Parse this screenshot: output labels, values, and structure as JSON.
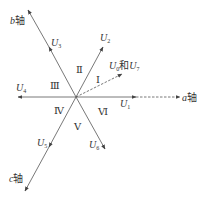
{
  "diagram": {
    "type": "space-vector-hexagon-sectors",
    "center": [
      76,
      97
    ],
    "axes": [
      {
        "id": "a",
        "label": "a",
        "suffix": "轴",
        "tip": [
          180,
          97
        ]
      },
      {
        "id": "b",
        "label": "b",
        "suffix": "轴",
        "tip": [
          28,
          10
        ]
      },
      {
        "id": "c",
        "label": "c",
        "suffix": "轴",
        "tip": [
          25,
          191
        ]
      }
    ],
    "vectors": [
      {
        "id": "U1",
        "base": "U",
        "sub": "1",
        "tip": [
          136,
          97
        ]
      },
      {
        "id": "U2",
        "base": "U",
        "sub": "2",
        "tip": [
          103,
          47
        ]
      },
      {
        "id": "U3",
        "base": "U",
        "sub": "3",
        "tip": [
          49,
          47
        ]
      },
      {
        "id": "U4",
        "base": "U",
        "sub": "4",
        "tip": [
          18,
          97
        ]
      },
      {
        "id": "U5",
        "base": "U",
        "sub": "5",
        "tip": [
          49,
          147
        ]
      },
      {
        "id": "U6",
        "base": "U",
        "sub": "6",
        "tip": [
          105,
          149
        ]
      },
      {
        "id": "U0U7",
        "base": "U",
        "sub": "0",
        "conj": "和",
        "base2": "U",
        "sub2": "7",
        "tip": [
          122,
          74
        ],
        "style": "dashed"
      }
    ],
    "sectors": [
      {
        "id": "I",
        "label": "Ⅰ",
        "pos": [
          97,
          81
        ]
      },
      {
        "id": "II",
        "label": "Ⅱ",
        "pos": [
          78,
          71
        ]
      },
      {
        "id": "III",
        "label": "Ⅲ",
        "pos": [
          53,
          87
        ]
      },
      {
        "id": "IV",
        "label": "Ⅳ",
        "pos": [
          57,
          112
        ]
      },
      {
        "id": "V",
        "label": "Ⅴ",
        "pos": [
          77,
          128
        ]
      },
      {
        "id": "VI",
        "label": "Ⅵ",
        "pos": [
          100,
          113
        ]
      }
    ],
    "colors": {
      "line": "#555555",
      "text": "#333333",
      "background": "#ffffff"
    }
  }
}
